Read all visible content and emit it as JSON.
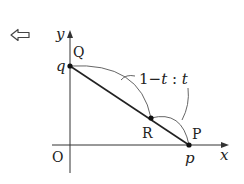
{
  "nav": {
    "back_icon": "left-outline-arrow-icon"
  },
  "axes": {
    "x_label": "x",
    "y_label": "y",
    "origin_label": "O"
  },
  "points": {
    "Q": {
      "label": "Q",
      "coord_label": "q"
    },
    "R": {
      "label": "R"
    },
    "P": {
      "label": "P",
      "coord_label": "p"
    }
  },
  "ratio_annotation": {
    "text_part1": "1−",
    "t1": "t",
    "colon": " : ",
    "t2": "t"
  },
  "colors": {
    "axis": "#333333",
    "segment": "#222222",
    "arc": "#555555",
    "point": "#111111"
  }
}
